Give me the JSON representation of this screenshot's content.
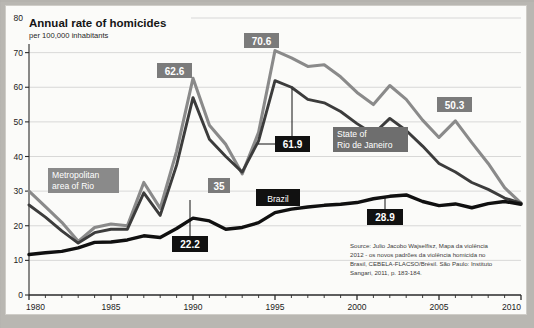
{
  "figure": {
    "title": "Annual rate of homicides",
    "subtitle": "per 100,000 inhabitants",
    "source_lines": [
      "Source: Julio Jacobo Wajselfisz, Mapa da violência",
      "2012 - os novos padrões da violência homicida no",
      "Brasil, CEBELA-FLACSO/Brésil. São Paulo: Instituto",
      "Sangari, 2011, p. 183-184."
    ],
    "colors": {
      "series_metro": "#8a8a8a",
      "series_brazil": "#101010",
      "callout_grey_bg": "#7b7b7b",
      "callout_dark_bg": "#111111",
      "paper": "#fbfbf9",
      "frame": "#b9b7b2",
      "grid": "#c9c9c9",
      "axis": "#2a2a2a"
    }
  },
  "labels": {
    "metro": "Metropolitan\narea of Rio",
    "metro_line1": "Metropolitan",
    "metro_line2": "area of Rio",
    "state": "State of\nRio de Janeiro",
    "state_line1": "State of",
    "state_line2": "Rio de Janeiro",
    "brazil": "Brazil"
  },
  "callouts": [
    {
      "name": "peak-1990-metro",
      "text": "62.6",
      "style": "grey"
    },
    {
      "name": "peak-1995-metro",
      "text": "70.6",
      "style": "grey"
    },
    {
      "name": "valley-1993-metro",
      "text": "35",
      "style": "grey"
    },
    {
      "name": "y2006-metro",
      "text": "50.3",
      "style": "grey"
    },
    {
      "name": "peak-1995-brazil-state",
      "text": "61.9",
      "style": "dark"
    },
    {
      "name": "y1990-brazil",
      "text": "22.2",
      "style": "dark"
    },
    {
      "name": "y2003-brazil",
      "text": "28.9",
      "style": "dark"
    }
  ],
  "chart_data": {
    "type": "line",
    "title": "Annual rate of homicides",
    "subtitle": "per 100,000 inhabitants",
    "xlabel": "",
    "ylabel": "per 100,000 inhabitants",
    "xlim": [
      1980,
      2010
    ],
    "ylim": [
      0,
      80
    ],
    "ytick_step": 10,
    "yticks": [
      0,
      10,
      20,
      30,
      40,
      50,
      60,
      70,
      80
    ],
    "xticks": [
      1980,
      1985,
      1990,
      1995,
      2000,
      2005,
      2010
    ],
    "xtick_minor_step": 1,
    "grid": "horizontal",
    "legend": "inline-labels",
    "x": [
      1980,
      1981,
      1982,
      1983,
      1984,
      1985,
      1986,
      1987,
      1988,
      1989,
      1990,
      1991,
      1992,
      1993,
      1994,
      1995,
      1996,
      1997,
      1998,
      1999,
      2000,
      2001,
      2002,
      2003,
      2004,
      2005,
      2006,
      2007,
      2008,
      2009,
      2010
    ],
    "series": [
      {
        "name": "Metropolitan area of Rio",
        "color": "#8a8a8a",
        "values": [
          30.0,
          25.5,
          21.0,
          15.5,
          19.5,
          20.5,
          20.0,
          32.5,
          25.0,
          41.5,
          62.6,
          49.0,
          43.5,
          35.0,
          47.0,
          70.6,
          68.5,
          66.0,
          66.5,
          63.0,
          58.5,
          55.0,
          60.5,
          56.5,
          50.5,
          45.5,
          50.3,
          44.0,
          38.0,
          31.0,
          26.5
        ]
      },
      {
        "name": "State of Rio de Janeiro",
        "color": "#3c3c3c",
        "values": [
          26.0,
          22.5,
          18.5,
          15.0,
          18.0,
          19.0,
          19.0,
          29.5,
          23.0,
          37.5,
          57.0,
          45.0,
          40.0,
          35.5,
          44.5,
          61.9,
          60.0,
          56.5,
          55.5,
          53.0,
          49.5,
          46.5,
          51.0,
          47.5,
          43.0,
          38.0,
          35.5,
          32.5,
          30.5,
          28.0,
          26.5
        ]
      },
      {
        "name": "Brazil",
        "color": "#101010",
        "values": [
          11.7,
          12.2,
          12.6,
          13.6,
          15.2,
          15.3,
          15.9,
          17.1,
          16.6,
          19.2,
          22.2,
          21.4,
          19.0,
          19.5,
          20.9,
          23.8,
          24.8,
          25.4,
          25.9,
          26.2,
          26.7,
          27.8,
          28.5,
          28.9,
          27.0,
          25.8,
          26.3,
          25.2,
          26.4,
          27.0,
          26.2
        ]
      }
    ]
  }
}
